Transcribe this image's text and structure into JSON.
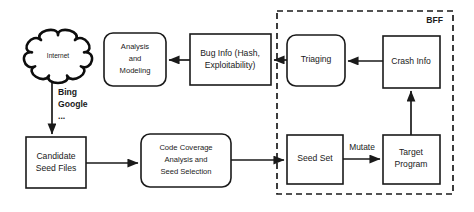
{
  "diagram": {
    "group": {
      "name": "bff-group",
      "label": "BFF",
      "x": 277,
      "y": 11,
      "width": 176,
      "height": 183
    },
    "nodes": [
      {
        "id": "internet",
        "name": "internet-cloud",
        "shape": "cloud",
        "label": "Internet",
        "x": 25,
        "y": 30,
        "width": 66,
        "height": 52,
        "label_x": 58,
        "label_y": 56
      },
      {
        "id": "candidate_seed_files",
        "name": "candidate-seed-files-box",
        "shape": "rect",
        "label_lines": [
          "Candidate",
          "Seed Files"
        ],
        "x": 26,
        "y": 137,
        "width": 60,
        "height": 51,
        "label_x": 56,
        "label_y": 163
      },
      {
        "id": "code_coverage",
        "name": "code-coverage-analysis-box",
        "shape": "round",
        "label_lines": [
          "Code Coverage",
          "Analysis and",
          "Seed Selection"
        ],
        "x": 141,
        "y": 134,
        "width": 90,
        "height": 53,
        "label_x": 186,
        "label_y": 160
      },
      {
        "id": "analysis_modeling",
        "name": "analysis-and-modeling-box",
        "shape": "round",
        "label_lines": [
          "Analysis",
          "and",
          "Modeling"
        ],
        "x": 104,
        "y": 33,
        "width": 62,
        "height": 53,
        "label_x": 135,
        "label_y": 59
      },
      {
        "id": "bug_info",
        "name": "bug-info-box",
        "shape": "rect",
        "label_lines": [
          "Bug Info (Hash,",
          "Exploitability)"
        ],
        "x": 190,
        "y": 34,
        "width": 81,
        "height": 51,
        "label_x": 230,
        "label_y": 60
      },
      {
        "id": "triaging",
        "name": "triaging-box",
        "shape": "round",
        "label_lines": [
          "Triaging"
        ],
        "x": 287,
        "y": 35,
        "width": 58,
        "height": 51,
        "label_x": 316,
        "label_y": 60
      },
      {
        "id": "crash_info",
        "name": "crash-info-box",
        "shape": "rect",
        "label_lines": [
          "Crash Info"
        ],
        "x": 383,
        "y": 36,
        "width": 57,
        "height": 52,
        "label_x": 411,
        "label_y": 62
      },
      {
        "id": "seed_set",
        "name": "seed-set-box",
        "shape": "rect",
        "label_lines": [
          "Seed Set"
        ],
        "x": 287,
        "y": 135,
        "width": 56,
        "height": 49,
        "label_x": 315,
        "label_y": 159
      },
      {
        "id": "target_program",
        "name": "target-program-box",
        "shape": "rect",
        "label_lines": [
          "Target",
          "Program"
        ],
        "x": 383,
        "y": 135,
        "width": 57,
        "height": 49,
        "label_x": 411,
        "label_y": 159
      }
    ],
    "edges": [
      {
        "id": "internet_to_candidate",
        "name": "edge-internet-to-candidate-seed-files",
        "path": "M 52 82 L 52 134",
        "arrow": "end"
      },
      {
        "id": "candidate_to_coverage",
        "name": "edge-candidate-seed-files-to-code-coverage",
        "path": "M 86 163 L 138 163",
        "arrow": "end"
      },
      {
        "id": "coverage_to_seedset",
        "name": "edge-code-coverage-to-seed-set",
        "path": "M 231 160 L 284 160",
        "arrow": "end"
      },
      {
        "id": "seedset_to_target",
        "name": "edge-seed-set-to-target-program",
        "path": "M 343 159 L 380 159",
        "arrow": "end"
      },
      {
        "id": "target_to_crash",
        "name": "edge-target-program-to-crash-info",
        "path": "M 411 135 L 411 91",
        "arrow": "end"
      },
      {
        "id": "crash_to_triaging",
        "name": "edge-crash-info-to-triaging",
        "path": "M 383 61 L 348 61",
        "arrow": "end"
      },
      {
        "id": "triaging_to_buginfo",
        "name": "edge-triaging-to-bug-info",
        "path": "M 287 60 L 274 60",
        "arrow": "end"
      },
      {
        "id": "buginfo_to_analysis",
        "name": "edge-bug-info-to-analysis-modeling",
        "path": "M 190 60 L 169 60",
        "arrow": "end"
      }
    ],
    "edge_labels": [
      {
        "id": "mutate",
        "name": "edge-label-mutate",
        "text": "Mutate",
        "x": 362,
        "y": 148
      }
    ],
    "annotations": [
      {
        "id": "search_engines",
        "name": "search-engines-annotation",
        "lines": [
          "Bing",
          "Google",
          "..."
        ],
        "x": 58,
        "y_start": 93,
        "line_height": 12
      }
    ]
  }
}
